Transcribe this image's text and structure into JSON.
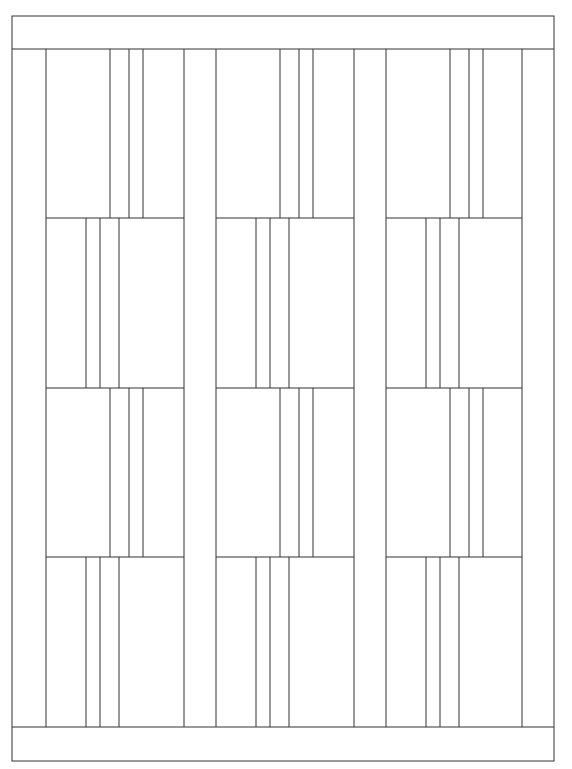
{
  "diagram": {
    "type": "quilt-pattern-line-drawing",
    "stroke_color": "#333333",
    "background": "#ffffff",
    "frame": {
      "x1": 12,
      "y1": 16,
      "x2": 554,
      "y2": 761
    },
    "top_band_bottom": 49,
    "bottom_band_top": 727,
    "sashing_columns": [
      [
        12,
        46
      ],
      [
        184,
        216
      ],
      [
        354,
        386
      ],
      [
        522,
        554
      ]
    ],
    "block_columns": [
      [
        46,
        184
      ],
      [
        216,
        354
      ],
      [
        386,
        522
      ]
    ],
    "row_boundaries": [
      49,
      218,
      388,
      557,
      727
    ],
    "rows": [
      {
        "orientation": "strips-right",
        "strip_offsets": [
          64,
          83,
          97
        ]
      },
      {
        "orientation": "strips-left",
        "strip_offsets": [
          40,
          54,
          73
        ]
      },
      {
        "orientation": "strips-right",
        "strip_offsets": [
          64,
          83,
          97
        ]
      },
      {
        "orientation": "strips-left",
        "strip_offsets": [
          40,
          54,
          73
        ]
      }
    ]
  }
}
